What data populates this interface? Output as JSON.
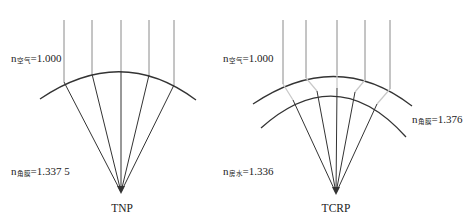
{
  "diagrams": [
    {
      "id": "tnp",
      "caption": "TNP",
      "labels": [
        {
          "n": "n",
          "sub": "空气",
          "value": "=1.000"
        },
        {
          "n": "n",
          "sub": "角膜",
          "value": "=1.337 5"
        }
      ]
    },
    {
      "id": "tcrp",
      "caption": "TCRP",
      "labels": [
        {
          "n": "n",
          "sub": "空气",
          "value": "=1.000"
        },
        {
          "n": "n",
          "sub": "角膜",
          "value": "=1.376"
        },
        {
          "n": "n",
          "sub": "房水",
          "value": "=1.336"
        }
      ]
    }
  ],
  "colors": {
    "ray": "#8a8a8a",
    "refracted_ray": "#333333",
    "surface": "#333333",
    "inner_ray": "#c8c8c8"
  }
}
